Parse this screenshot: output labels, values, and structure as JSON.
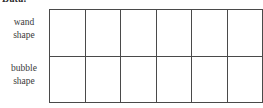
{
  "heading": {
    "text": "Data:",
    "note": "bold heading clipped by the top edge of the screenshot"
  },
  "worksheet": {
    "row_labels": [
      {
        "id": "wand-shape",
        "line1": "wand",
        "line2": "shape"
      },
      {
        "id": "bubble-shape",
        "line1": "bubble",
        "line2": "shape"
      }
    ],
    "grid": {
      "columns": 6,
      "rows": 2,
      "cells_empty": true,
      "border_color": "#4a4a4a",
      "background_color": "#ffffff",
      "row_values": [
        [
          "",
          "",
          "",
          "",
          "",
          ""
        ],
        [
          "",
          "",
          "",
          "",
          "",
          ""
        ]
      ]
    }
  },
  "colors": {
    "page_background": "#ffffff",
    "text": "#3a3a3a",
    "heading_text": "#2b2b2b",
    "rule": "#4a4a4a"
  }
}
